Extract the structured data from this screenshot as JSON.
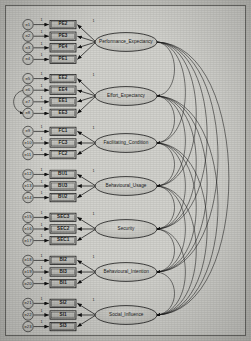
{
  "diagram": {
    "type": "sem-path-diagram",
    "background_color": "#d2d2cd",
    "node_fill": "#c9c9c4",
    "stroke_color": "#1b1b1b",
    "groups": [
      {
        "factor": "Performance_Expectancy",
        "factor_id": "performance-expectancy",
        "cy": 36,
        "indicators": [
          {
            "label": "PE2",
            "error": "e1",
            "loading": "1"
          },
          {
            "label": "PE3",
            "error": "e2",
            "loading": "1"
          },
          {
            "label": "PE4",
            "error": "e3",
            "loading": "1"
          },
          {
            "label": "PE1",
            "error": "e4",
            "loading": "1"
          }
        ]
      },
      {
        "factor": "Effort_Expectancy",
        "factor_id": "effort-expectancy",
        "cy": 90,
        "indicators": [
          {
            "label": "EE2",
            "error": "e5",
            "loading": "1"
          },
          {
            "label": "EE4",
            "error": "e6",
            "loading": "1"
          },
          {
            "label": "EE1",
            "error": "e7",
            "loading": "1"
          },
          {
            "label": "EE3",
            "error": "e8",
            "loading": "1"
          }
        ]
      },
      {
        "factor": "Facilitating_Condition",
        "factor_id": "facilitating-condition",
        "cy": 137,
        "indicators": [
          {
            "label": "FC1",
            "error": "e9",
            "loading": "1"
          },
          {
            "label": "FC3",
            "error": "e10",
            "loading": "1"
          },
          {
            "label": "FC2",
            "error": "e11",
            "loading": "1"
          }
        ]
      },
      {
        "factor": "Behavioural_Usage",
        "factor_id": "behavioural-usage",
        "cy": 180,
        "indicators": [
          {
            "label": "BU1",
            "error": "e12",
            "loading": "1"
          },
          {
            "label": "BU3",
            "error": "e13",
            "loading": "1"
          },
          {
            "label": "BU2",
            "error": "e14",
            "loading": "1"
          }
        ]
      },
      {
        "factor": "Security",
        "factor_id": "security",
        "cy": 223,
        "indicators": [
          {
            "label": "SEC3",
            "error": "e15",
            "loading": "1"
          },
          {
            "label": "SEC2",
            "error": "e16",
            "loading": "1"
          },
          {
            "label": "SEC1",
            "error": "e17",
            "loading": "1"
          }
        ]
      },
      {
        "factor": "Behavioural_Intention",
        "factor_id": "behavioural-intention",
        "cy": 266,
        "indicators": [
          {
            "label": "BI2",
            "error": "e18",
            "loading": "1"
          },
          {
            "label": "BI3",
            "error": "e19",
            "loading": "1"
          },
          {
            "label": "BI1",
            "error": "e20",
            "loading": "1"
          }
        ]
      },
      {
        "factor": "Social_Influence",
        "factor_id": "social-influence",
        "cy": 309,
        "indicators": [
          {
            "label": "SI2",
            "error": "e21",
            "loading": "1"
          },
          {
            "label": "SI1",
            "error": "e22",
            "loading": "1"
          },
          {
            "label": "SI3",
            "error": "e23",
            "loading": "1"
          }
        ]
      }
    ],
    "error_correlation": {
      "between": [
        "e6",
        "e8"
      ],
      "note": "curved double-headed arc on left between EE4 and EE3 errors"
    },
    "covariance_count": 21
  }
}
